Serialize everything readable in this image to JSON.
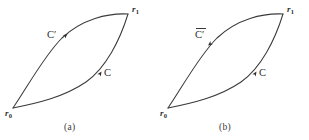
{
  "figure": {
    "type": "path-diagram",
    "width": 309,
    "height": 140,
    "background_color": "#ffffff",
    "stroke_color": "#3a3a3a",
    "text_color": "#2e2e2e"
  },
  "panels": [
    {
      "id": "a",
      "caption": "(a)",
      "endpoints": {
        "start_label_base": "r",
        "start_label_sub": "0",
        "end_label_base": "r",
        "end_label_sub": "1"
      },
      "curves": [
        {
          "name": "upper-curve",
          "label": "C",
          "prime": "′",
          "overline": false,
          "direction": "forward",
          "arrow_direction": "up-right"
        },
        {
          "name": "lower-curve",
          "label": "C",
          "prime": "",
          "overline": false,
          "direction": "forward",
          "arrow_direction": "up-right"
        }
      ]
    },
    {
      "id": "b",
      "caption": "(b)",
      "endpoints": {
        "start_label_base": "r",
        "start_label_sub": "0",
        "end_label_base": "r",
        "end_label_sub": "1"
      },
      "curves": [
        {
          "name": "upper-curve",
          "label": "C",
          "prime": "′",
          "overline": true,
          "direction": "reversed",
          "arrow_direction": "down-left"
        },
        {
          "name": "lower-curve",
          "label": "C",
          "prime": "",
          "overline": false,
          "direction": "forward",
          "arrow_direction": "up-right"
        }
      ]
    }
  ]
}
